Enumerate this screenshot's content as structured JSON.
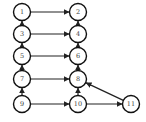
{
  "diagram": {
    "type": "directed-graph",
    "nodes": [
      {
        "id": "1",
        "label": "1",
        "x": 22,
        "y": 12
      },
      {
        "id": "2",
        "label": "2",
        "x": 78,
        "y": 12
      },
      {
        "id": "3",
        "label": "3",
        "x": 22,
        "y": 34
      },
      {
        "id": "4",
        "label": "4",
        "x": 78,
        "y": 34
      },
      {
        "id": "5",
        "label": "5",
        "x": 22,
        "y": 56
      },
      {
        "id": "6",
        "label": "6",
        "x": 78,
        "y": 56
      },
      {
        "id": "7",
        "label": "7",
        "x": 22,
        "y": 79
      },
      {
        "id": "8",
        "label": "8",
        "x": 78,
        "y": 79
      },
      {
        "id": "9",
        "label": "9",
        "x": 22,
        "y": 104
      },
      {
        "id": "10",
        "label": "10",
        "x": 78,
        "y": 104
      },
      {
        "id": "11",
        "label": "11",
        "x": 131,
        "y": 104
      }
    ],
    "edges": [
      {
        "from": "1",
        "to": "2"
      },
      {
        "from": "3",
        "to": "4"
      },
      {
        "from": "5",
        "to": "6"
      },
      {
        "from": "7",
        "to": "8"
      },
      {
        "from": "9",
        "to": "10"
      },
      {
        "from": "10",
        "to": "11"
      },
      {
        "from": "3",
        "to": "1"
      },
      {
        "from": "5",
        "to": "3"
      },
      {
        "from": "7",
        "to": "5"
      },
      {
        "from": "9",
        "to": "7"
      },
      {
        "from": "4",
        "to": "2"
      },
      {
        "from": "6",
        "to": "4"
      },
      {
        "from": "8",
        "to": "6"
      },
      {
        "from": "10",
        "to": "8"
      },
      {
        "from": "11",
        "to": "8"
      }
    ]
  }
}
